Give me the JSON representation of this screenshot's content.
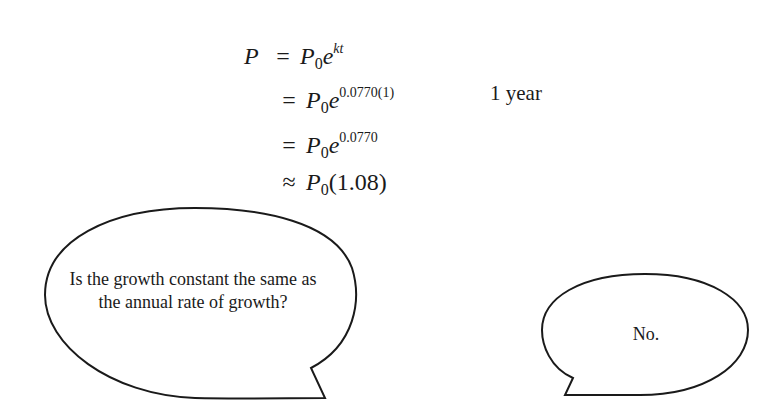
{
  "equation": {
    "line1": {
      "lhs": "P",
      "op": "=",
      "base": "P",
      "sub": "0",
      "e": "e",
      "exp": "kt"
    },
    "line2": {
      "op": "=",
      "base": "P",
      "sub": "0",
      "e": "e",
      "exp": "0.0770(1)"
    },
    "line3": {
      "op": "=",
      "base": "P",
      "sub": "0",
      "e": "e",
      "exp": "0.0770"
    },
    "line4": {
      "op": "≈",
      "base": "P",
      "sub": "0",
      "rest": "(1.08)"
    }
  },
  "annotation": {
    "line2_note": "1 year"
  },
  "bubbles": {
    "question": {
      "text": "Is the growth constant the same as the annual rate of growth?"
    },
    "answer": {
      "text": "No."
    }
  }
}
